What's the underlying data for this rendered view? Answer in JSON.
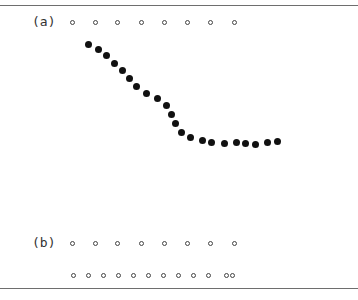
{
  "figure": {
    "panel_a": {
      "label": "(a)",
      "open_circles_y": 22,
      "open_circles_x": [
        72,
        95,
        117,
        141,
        164,
        187,
        210,
        234
      ],
      "filled_dots": [
        [
          88,
          44
        ],
        [
          98,
          49
        ],
        [
          106,
          55
        ],
        [
          114,
          63
        ],
        [
          122,
          70
        ],
        [
          129,
          78
        ],
        [
          136,
          86
        ],
        [
          146,
          93
        ],
        [
          157,
          98
        ],
        [
          166,
          105
        ],
        [
          171,
          114
        ],
        [
          175,
          123
        ],
        [
          181,
          132
        ],
        [
          190,
          137
        ],
        [
          202,
          140
        ],
        [
          211,
          142
        ],
        [
          224,
          143
        ],
        [
          236,
          142
        ],
        [
          245,
          143
        ],
        [
          255,
          144
        ],
        [
          267,
          142
        ],
        [
          277,
          141
        ]
      ]
    },
    "panel_b": {
      "label": "(b)",
      "row1_y": 243,
      "row1_x": [
        72,
        95,
        117,
        141,
        164,
        187,
        210,
        234
      ],
      "row2_y": 275,
      "row2_x": [
        73,
        88,
        103,
        118,
        133,
        148,
        163,
        178,
        193,
        208,
        226,
        232
      ]
    }
  },
  "colors": {
    "rule": "#6e6e6e",
    "dot": "#111111",
    "circle": "#444444"
  }
}
